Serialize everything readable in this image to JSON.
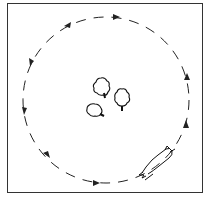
{
  "diagram": {
    "frame": {
      "stroke": "#333333"
    },
    "path": {
      "shape": "circle",
      "style": "dashed",
      "direction": "counterclockwise",
      "arrow_count": 10
    },
    "sheep": [
      {
        "label": "sheep-1",
        "x": 101,
        "y": 88
      },
      {
        "label": "sheep-2",
        "x": 123,
        "y": 99
      },
      {
        "label": "sheep-3",
        "x": 95,
        "y": 109
      }
    ],
    "dog": {
      "label": "dog",
      "x": 158,
      "y": 165
    },
    "colors": {
      "ink": "#222222",
      "background": "#ffffff"
    }
  }
}
